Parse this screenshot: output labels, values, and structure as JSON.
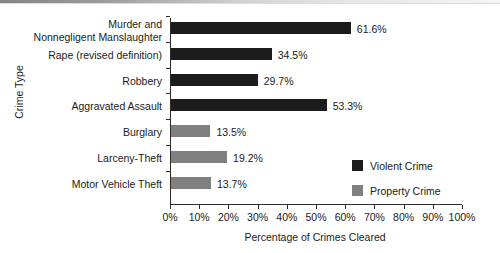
{
  "chart_data": {
    "type": "bar",
    "orientation": "horizontal",
    "title": "",
    "xlabel": "Percentage of Crimes Cleared",
    "ylabel": "Crime Type",
    "xlim": [
      0,
      100
    ],
    "grid": false,
    "legend_position": "inside-right",
    "categories": [
      "Murder and\nNonnegligent Manslaughter",
      "Rape (revised definition)",
      "Robbery",
      "Aggravated Assault",
      "Burglary",
      "Larceny-Theft",
      "Motor Vehicle Theft"
    ],
    "values": [
      61.6,
      34.5,
      29.7,
      53.3,
      13.5,
      19.2,
      13.7
    ],
    "value_labels": [
      "61.6%",
      "34.5%",
      "29.7%",
      "53.3%",
      "13.5%",
      "19.2%",
      "13.7%"
    ],
    "series_of_category": [
      "Violent Crime",
      "Violent Crime",
      "Violent Crime",
      "Violent Crime",
      "Property Crime",
      "Property Crime",
      "Property Crime"
    ],
    "xticks": [
      0,
      10,
      20,
      30,
      40,
      50,
      60,
      70,
      80,
      90,
      100
    ],
    "xtick_labels": [
      "0%",
      "10%",
      "20%",
      "30%",
      "40%",
      "50%",
      "60%",
      "70%",
      "80%",
      "90%",
      "100%"
    ],
    "legend": [
      {
        "name": "Violent Crime",
        "color": "#1c1c1c"
      },
      {
        "name": "Property Crime",
        "color": "#808080"
      }
    ],
    "colors": {
      "violent": "#1c1c1c",
      "property": "#808080",
      "axis": "#2b2b2b",
      "text": "#1a1a1a",
      "background": "#ffffff"
    }
  },
  "rows": [
    {
      "label_line1": "Murder and",
      "label_line2": "Nonnegligent Manslaughter",
      "value_label": "61.6%",
      "series": "violent"
    },
    {
      "label_line1": "Rape (revised definition)",
      "label_line2": "",
      "value_label": "34.5%",
      "series": "violent"
    },
    {
      "label_line1": "Robbery",
      "label_line2": "",
      "value_label": "29.7%",
      "series": "violent"
    },
    {
      "label_line1": "Aggravated Assault",
      "label_line2": "",
      "value_label": "53.3%",
      "series": "violent"
    },
    {
      "label_line1": "Burglary",
      "label_line2": "",
      "value_label": "13.5%",
      "series": "property"
    },
    {
      "label_line1": "Larceny-Theft",
      "label_line2": "",
      "value_label": "19.2%",
      "series": "property"
    },
    {
      "label_line1": "Motor Vehicle Theft",
      "label_line2": "",
      "value_label": "13.7%",
      "series": "property"
    }
  ]
}
